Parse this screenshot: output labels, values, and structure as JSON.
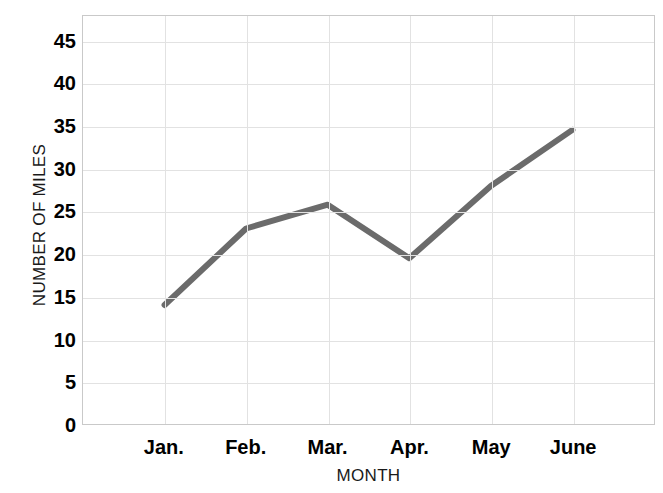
{
  "chart_data": {
    "type": "line",
    "title": "",
    "subtitle": "",
    "xlabel": "MONTH",
    "ylabel": "NUMBER OF MILES",
    "categories": [
      "Jan.",
      "Feb.",
      "Mar.",
      "Apr.",
      "May",
      "June"
    ],
    "values": [
      14,
      23,
      25.8,
      19.5,
      28,
      34.6
    ],
    "series": [
      {
        "name": "Number of Miles",
        "values": [
          14,
          23,
          25.8,
          19.5,
          28,
          34.6
        ]
      }
    ],
    "ylim": [
      0,
      48
    ],
    "xlim": [
      0,
      7
    ],
    "yticks": [
      0,
      5,
      10,
      15,
      20,
      25,
      30,
      35,
      40,
      45
    ],
    "ytick_labels": [
      "0",
      "5",
      "10",
      "15",
      "20",
      "25",
      "30",
      "35",
      "40",
      "45"
    ],
    "xtick_labels": [
      "Jan.",
      "Feb.",
      "Mar.",
      "Apr.",
      "May",
      "June"
    ],
    "grid": true,
    "grid_axis": "both",
    "legend": false,
    "legend_position": "none",
    "line_color": "#6b6b6b",
    "line_width": 6,
    "grid_color": "#e2e2e2",
    "border_color": "#c9c9c9",
    "background_color": "#ffffff",
    "markers": false,
    "annotations": []
  }
}
